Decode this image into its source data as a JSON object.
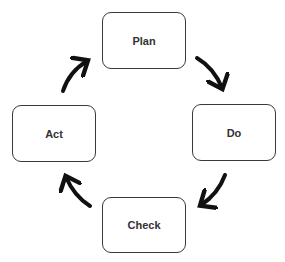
{
  "diagram": {
    "type": "cycle",
    "nodes": [
      {
        "id": "plan",
        "label": "Plan"
      },
      {
        "id": "do",
        "label": "Do"
      },
      {
        "id": "check",
        "label": "Check"
      },
      {
        "id": "act",
        "label": "Act"
      }
    ],
    "edges": [
      {
        "from": "plan",
        "to": "do"
      },
      {
        "from": "do",
        "to": "check"
      },
      {
        "from": "check",
        "to": "act"
      },
      {
        "from": "act",
        "to": "plan"
      }
    ],
    "colors": {
      "border": "#3a3a3a",
      "arrow": "#111111",
      "text": "#333333"
    }
  }
}
